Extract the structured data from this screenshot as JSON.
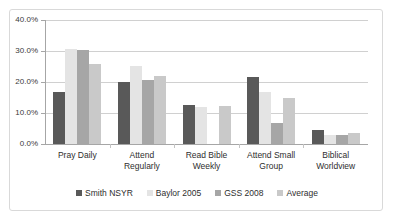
{
  "chart_data": {
    "type": "bar",
    "title": "",
    "subtitle": "",
    "xlabel": "",
    "ylabel": "",
    "ylim": [
      0,
      40
    ],
    "ytick_labels": [
      "0.0%",
      "10.0%",
      "20.0%",
      "30.0%",
      "40.0%"
    ],
    "ytick_values": [
      0,
      10,
      20,
      30,
      40
    ],
    "grid": true,
    "legend_position": "bottom",
    "categories": [
      "Pray Daily",
      "Attend Regularly",
      "Read Bible Weekly",
      "Attend Small Group",
      "Biblical Worldview"
    ],
    "category_lines": [
      [
        "Pray Daily"
      ],
      [
        "Attend",
        "Regularly"
      ],
      [
        "Read Bible",
        "Weekly"
      ],
      [
        "Attend Small",
        "Group"
      ],
      [
        "Biblical",
        "Worldview"
      ]
    ],
    "series": [
      {
        "name": "Smith NSYR",
        "color": "#595959",
        "values": [
          16.8,
          20.0,
          12.6,
          21.5,
          4.6
        ]
      },
      {
        "name": "Baylor 2005",
        "color": "#e4e4e4",
        "values": [
          30.6,
          25.1,
          12.1,
          16.9,
          2.8
        ]
      },
      {
        "name": "GSS 2008",
        "color": "#a6a6a6",
        "values": [
          30.3,
          20.5,
          0.0,
          6.7,
          2.9
        ]
      },
      {
        "name": "Average",
        "color": "#c9c9c9",
        "values": [
          25.9,
          21.9,
          12.3,
          15.0,
          3.4
        ]
      }
    ]
  },
  "colors": {
    "frame_border": "#d9d9d9",
    "gridline": "#d0d0d0",
    "axis": "#a6a6a6",
    "text": "#2e2e2e",
    "background": "#ffffff"
  }
}
